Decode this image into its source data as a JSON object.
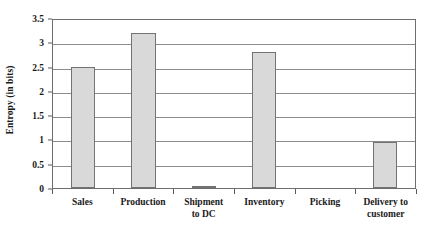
{
  "chart_data": {
    "type": "bar",
    "title": "",
    "xlabel": "",
    "ylabel": "Entropy (in bits)",
    "categories": [
      "Sales",
      "Production",
      "Shipment to DC",
      "Inventory",
      "Picking",
      "Delivery to customer"
    ],
    "category_lines": [
      [
        "Sales"
      ],
      [
        "Production"
      ],
      [
        "Shipment",
        "to DC"
      ],
      [
        "Inventory"
      ],
      [
        "Picking"
      ],
      [
        "Delivery to",
        "customer"
      ]
    ],
    "values": [
      2.5,
      3.2,
      0.05,
      2.8,
      0,
      0.95
    ],
    "ylim": [
      0,
      3.5
    ],
    "ytick_labels": [
      "3.5",
      "3",
      "2.5",
      "2",
      "1.5",
      "1",
      "0.5",
      "0"
    ],
    "ytick_values": [
      3.5,
      3,
      2.5,
      2,
      1.5,
      1,
      0.5,
      0
    ],
    "grid": true,
    "legend": false,
    "bar_fill_color": "#d9d9d9",
    "bar_border_color": "#737373",
    "gridline_color": "#8c8c8c",
    "axis_color": "#6e6e6e",
    "background_color": "#ffffff"
  }
}
